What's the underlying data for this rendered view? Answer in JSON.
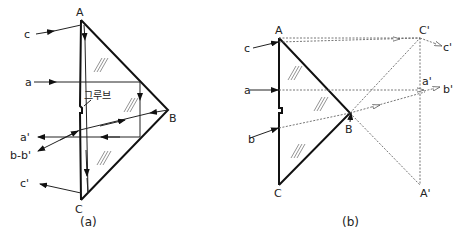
{
  "figure_a": {
    "caption": "(a)",
    "vertex_labels": {
      "A": "A",
      "B": "B",
      "C": "C"
    },
    "input_labels": {
      "c": "c",
      "a": "a"
    },
    "output_labels": {
      "a_prime": "a'",
      "b_b_prime": "b-b'",
      "c_prime": "c'"
    },
    "groove_label": "그루브"
  },
  "figure_b": {
    "caption": "(b)",
    "vertex_labels": {
      "A": "A",
      "B": "B",
      "C": "C",
      "C_prime": "C'",
      "A_prime": "A'"
    },
    "input_labels": {
      "c": "c",
      "a": "a",
      "b": "b"
    },
    "output_labels": {
      "c_prime": "c'",
      "a_prime": "a'",
      "b_prime": "b'"
    }
  },
  "colors": {
    "line": "#111111",
    "dashed": "#666666",
    "background": "#ffffff"
  }
}
